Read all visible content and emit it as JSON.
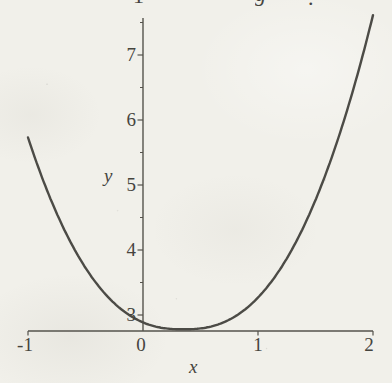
{
  "figure": {
    "kind": "scanned-textbook-plot",
    "background_color": "#f1f0ea",
    "ink_color": "#45443e",
    "axis_color": "#55534c",
    "curve_color": "#4c4b46"
  },
  "cropped_fragments": [
    {
      "glyph": "1",
      "x": 133,
      "dy": -15,
      "italic": false
    },
    {
      "glyph": "g",
      "x": 255,
      "dy": -17,
      "italic": true
    },
    {
      "glyph": ".",
      "x": 308,
      "dy": -13,
      "italic": false
    }
  ],
  "chart_data": {
    "type": "line",
    "title": "",
    "xlabel": "x",
    "ylabel": "y",
    "xlim": [
      -1,
      2
    ],
    "ylim": [
      2.75,
      7.75
    ],
    "x_ticks": [
      -1,
      0,
      1,
      2
    ],
    "y_ticks": [
      3,
      4,
      5,
      6,
      7
    ],
    "y_minor_ticks": [
      3.5,
      4.5,
      5.5,
      6.5,
      7.5
    ],
    "grid": false,
    "legend": false,
    "series": [
      {
        "name": "curve",
        "x": [
          -1,
          -0.75,
          -0.5,
          -0.25,
          0,
          0.25,
          0.5,
          0.75,
          1,
          1.25,
          1.5,
          1.75,
          2
        ],
        "y": [
          5.73,
          4.56,
          3.73,
          3.18,
          2.89,
          2.78,
          2.79,
          2.93,
          3.27,
          3.87,
          4.77,
          6.0,
          7.62
        ]
      }
    ],
    "model": {
      "form": "y = k + A*|x-h|^p",
      "k": 2.78,
      "A": 1.41,
      "h": 0.35,
      "p": 2.46,
      "x_range": [
        -1,
        2.01
      ]
    }
  }
}
